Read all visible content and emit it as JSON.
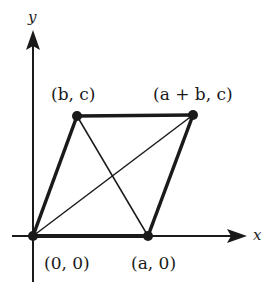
{
  "diagram": {
    "type": "parallelogram-on-axes",
    "colors": {
      "ink": "#1a1a1a",
      "background": "#ffffff"
    },
    "axes": {
      "x_label": "x",
      "y_label": "y"
    },
    "points": [
      {
        "id": "origin",
        "label": "(0, 0)"
      },
      {
        "id": "a0",
        "label": "(a, 0)"
      },
      {
        "id": "bc",
        "label": "(b, c)"
      },
      {
        "id": "abc",
        "label": "(a + b, c)"
      }
    ],
    "edges": [
      {
        "from": "origin",
        "to": "a0",
        "style": "thick"
      },
      {
        "from": "origin",
        "to": "bc",
        "style": "thick"
      },
      {
        "from": "bc",
        "to": "abc",
        "style": "thick"
      },
      {
        "from": "a0",
        "to": "abc",
        "style": "thick"
      },
      {
        "from": "origin",
        "to": "abc",
        "style": "thin",
        "role": "diagonal"
      },
      {
        "from": "bc",
        "to": "a0",
        "style": "thin",
        "role": "diagonal"
      }
    ]
  }
}
